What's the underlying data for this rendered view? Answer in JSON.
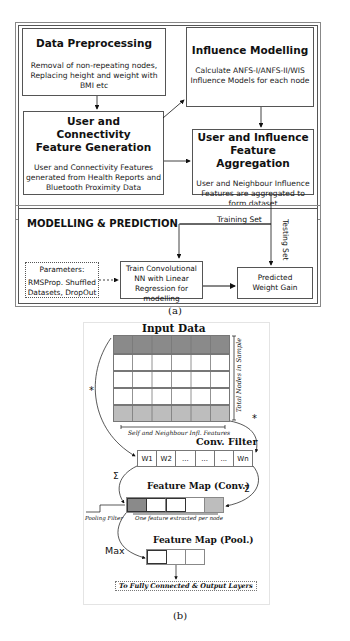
{
  "figure_a": {
    "caption": "(a)",
    "data_preprocessing": {
      "title": "Data Preprocessing",
      "desc": "Removal of non-repeating nodes, Replacing height and weight with BMI etc"
    },
    "influence_modelling": {
      "title": "Influence Modelling",
      "desc": "Calculate ANFS-I/ANFS-II/WIS Influence Models for each node"
    },
    "feature_generation": {
      "title": "User and Connectivity Feature Generation",
      "desc": "User and Connectivity Features generated from Health Reports and Bluetooth Proximity Data"
    },
    "feature_aggregation": {
      "title": "User and Influence Feature Aggregation",
      "desc": "User and Neighbour Influence Features are aggregated to form dataset"
    },
    "modelling": {
      "title": "MODELLING & PREDICTION",
      "parameters_title": "Parameters:",
      "parameters_desc": "RMSProp. Shuffled Datasets, DropOut",
      "train_box": "Train Convolutional NN with Linear Regression for modelling",
      "predict_box": "Predicted Weight Gain",
      "training_set_label": "Training Set",
      "testing_set_label": "Testing Set"
    }
  },
  "figure_b": {
    "caption": "(b)",
    "input_data_title": "Input Data",
    "total_nodes_label": "Total Nodes in Sample",
    "features_label": "Self and Neighbour Infl. Features",
    "conv_filter_title": "Conv. Filter",
    "filter_cells": [
      "W1",
      "W2",
      "...",
      "...",
      "...",
      "Wn"
    ],
    "feature_map_conv_title": "Feature Map (Conv.)",
    "one_feature_label": "One feature extracted per node",
    "pooling_filter_label": "Pooling Filter",
    "feature_map_pool_title": "Feature Map (Pool.)",
    "max_label": "Max",
    "sum_symbol": "Σ",
    "star_symbol": "*",
    "output_label": "To Fully Connected & Output Layers"
  }
}
